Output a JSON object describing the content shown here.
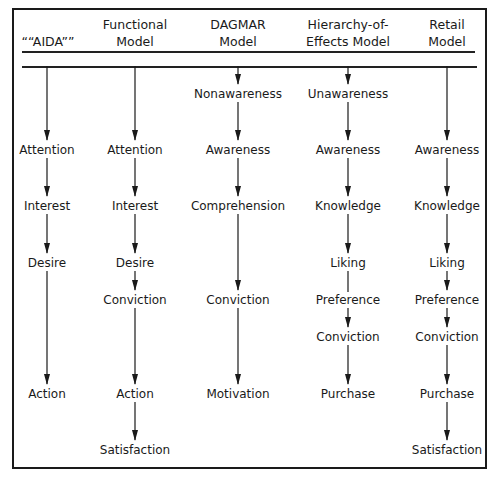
{
  "columns": [
    {
      "id": "aida",
      "header": [
        "““AIDA””"
      ],
      "x": 47,
      "stages": [
        {
          "label": "Attention",
          "y": 150
        },
        {
          "label": "Interest",
          "y": 206
        },
        {
          "label": "Desire",
          "y": 263
        },
        {
          "label": "Action",
          "y": 394
        }
      ],
      "start_y": 66,
      "arrows": [
        true,
        true,
        true,
        true
      ]
    },
    {
      "id": "functional",
      "header": [
        "Functional",
        "Model"
      ],
      "x": 135,
      "stages": [
        {
          "label": "Attention",
          "y": 150
        },
        {
          "label": "Interest",
          "y": 206
        },
        {
          "label": "Desire",
          "y": 263
        },
        {
          "label": "Conviction",
          "y": 300
        },
        {
          "label": "Action",
          "y": 394
        },
        {
          "label": "Satisfaction",
          "y": 450
        }
      ],
      "start_y": 66,
      "arrows": [
        true,
        true,
        true,
        true,
        true,
        true
      ]
    },
    {
      "id": "dagmar",
      "header": [
        "DAGMAR",
        "Model"
      ],
      "x": 238,
      "stages": [
        {
          "label": "Nonawareness",
          "y": 94
        },
        {
          "label": "Awareness",
          "y": 150
        },
        {
          "label": "Comprehension",
          "y": 206
        },
        {
          "label": "Conviction",
          "y": 300
        },
        {
          "label": "Motivation",
          "y": 394
        }
      ],
      "start_y": 66,
      "arrows": [
        true,
        true,
        true,
        true,
        true
      ]
    },
    {
      "id": "hierarchy",
      "header": [
        "Hierarchy-of-",
        "Effects Model"
      ],
      "x": 348,
      "stages": [
        {
          "label": "Unawareness",
          "y": 94
        },
        {
          "label": "Awareness",
          "y": 150
        },
        {
          "label": "Knowledge",
          "y": 206
        },
        {
          "label": "Liking",
          "y": 263
        },
        {
          "label": "Preference",
          "y": 300
        },
        {
          "label": "Conviction",
          "y": 337
        },
        {
          "label": "Purchase",
          "y": 394
        }
      ],
      "start_y": 66,
      "arrows": [
        true,
        true,
        true,
        true,
        false,
        true,
        true
      ]
    },
    {
      "id": "retail",
      "header": [
        "Retail",
        "Model"
      ],
      "x": 447,
      "stages": [
        {
          "label": "Awareness",
          "y": 150
        },
        {
          "label": "Knowledge",
          "y": 206
        },
        {
          "label": "Liking",
          "y": 263
        },
        {
          "label": "Preference",
          "y": 300
        },
        {
          "label": "Conviction",
          "y": 337
        },
        {
          "label": "Purchase",
          "y": 394
        },
        {
          "label": "Satisfaction",
          "y": 450
        }
      ],
      "start_y": 66,
      "arrows": [
        true,
        true,
        true,
        true,
        true,
        true,
        true
      ]
    }
  ],
  "style": {
    "line_color": "#1a1a1a",
    "background": "#ffffff"
  }
}
